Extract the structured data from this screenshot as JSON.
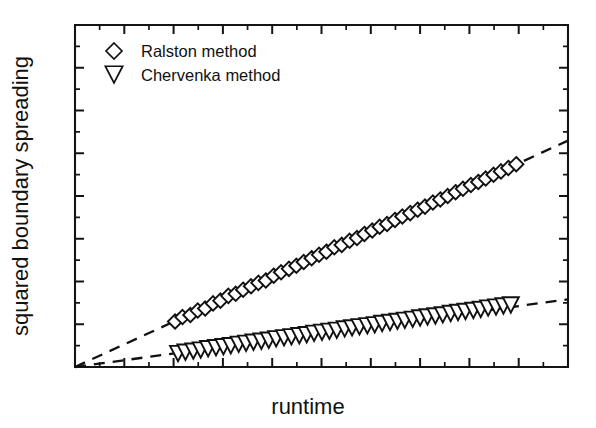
{
  "chart_data": {
    "type": "scatter",
    "title": "",
    "xlabel": "runtime",
    "ylabel": "squared boundary spreading",
    "grid": false,
    "legend_position": "top-left-inside",
    "axis_tick_labels": "none",
    "xlim": [
      0,
      1
    ],
    "ylim": [
      0,
      1
    ],
    "x_major_ticks": 9,
    "x_minor_ticks": 9,
    "y_major_ticks": 7,
    "y_minor_ticks": 6,
    "series": [
      {
        "name": "Ralston method",
        "marker": "diamond-open",
        "slope": 0.662,
        "intercept": 0.0,
        "fit_style": "dashed",
        "x": [
          0.203,
          0.218,
          0.234,
          0.249,
          0.264,
          0.28,
          0.295,
          0.311,
          0.326,
          0.341,
          0.357,
          0.372,
          0.387,
          0.403,
          0.418,
          0.434,
          0.449,
          0.464,
          0.48,
          0.495,
          0.51,
          0.526,
          0.541,
          0.557,
          0.572,
          0.587,
          0.603,
          0.618,
          0.633,
          0.649,
          0.664,
          0.68,
          0.695,
          0.71,
          0.726,
          0.741,
          0.756,
          0.772,
          0.787,
          0.803,
          0.818,
          0.833,
          0.849,
          0.864,
          0.879,
          0.895
        ],
        "y": [
          0.133,
          0.146,
          0.152,
          0.165,
          0.171,
          0.186,
          0.194,
          0.208,
          0.214,
          0.226,
          0.236,
          0.246,
          0.253,
          0.267,
          0.277,
          0.287,
          0.296,
          0.307,
          0.318,
          0.328,
          0.337,
          0.35,
          0.357,
          0.369,
          0.377,
          0.389,
          0.399,
          0.41,
          0.418,
          0.43,
          0.44,
          0.45,
          0.46,
          0.469,
          0.481,
          0.49,
          0.5,
          0.511,
          0.521,
          0.532,
          0.541,
          0.551,
          0.562,
          0.572,
          0.582,
          0.593
        ]
      },
      {
        "name": "Chervenka method",
        "marker": "triangle-down-open",
        "slope": 0.198,
        "intercept": 0.0,
        "fit_style": "dashed",
        "x": [
          0.209,
          0.224,
          0.24,
          0.255,
          0.27,
          0.286,
          0.301,
          0.316,
          0.332,
          0.347,
          0.362,
          0.378,
          0.393,
          0.408,
          0.424,
          0.439,
          0.455,
          0.47,
          0.485,
          0.501,
          0.516,
          0.531,
          0.547,
          0.562,
          0.577,
          0.593,
          0.608,
          0.623,
          0.639,
          0.654,
          0.669,
          0.685,
          0.7,
          0.715,
          0.731,
          0.746,
          0.762,
          0.777,
          0.792,
          0.808,
          0.823,
          0.838,
          0.854,
          0.869,
          0.884
        ],
        "y": [
          0.041,
          0.045,
          0.048,
          0.051,
          0.055,
          0.058,
          0.061,
          0.064,
          0.068,
          0.071,
          0.074,
          0.077,
          0.08,
          0.084,
          0.087,
          0.09,
          0.093,
          0.096,
          0.1,
          0.103,
          0.106,
          0.109,
          0.113,
          0.116,
          0.119,
          0.122,
          0.125,
          0.129,
          0.132,
          0.135,
          0.138,
          0.141,
          0.145,
          0.148,
          0.151,
          0.154,
          0.158,
          0.161,
          0.164,
          0.167,
          0.17,
          0.174,
          0.177,
          0.18,
          0.183
        ]
      }
    ]
  },
  "legend": {
    "entries": [
      {
        "label": "Ralston method",
        "marker": "diamond-open"
      },
      {
        "label": "Chervenka method",
        "marker": "triangle-down-open"
      }
    ]
  },
  "axes": {
    "x_title": "runtime",
    "y_title": "squared boundary spreading"
  },
  "colors": {
    "foreground": "#111111",
    "background": "#ffffff",
    "marker_fill": "#ffffff"
  }
}
